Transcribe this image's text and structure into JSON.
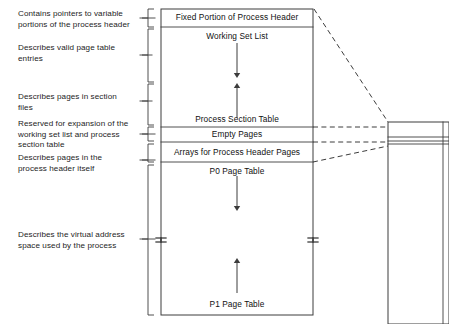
{
  "diagram": {
    "colors": {
      "stroke": "#3c3c3c",
      "text": "#1a1a1a",
      "background": "#ffffff"
    },
    "captions": [
      {
        "id": "caption-variable-portions",
        "text": "Contains pointers to variable\nportions of the process header",
        "x": 18,
        "y": 9,
        "leader_y": 18,
        "leader_x1": 140,
        "leader_x2": 155
      },
      {
        "id": "caption-valid-page-table",
        "text": "Describes valid page table\nentries",
        "x": 18,
        "y": 43,
        "leader_y": 55,
        "leader_x1": 140,
        "leader_x2": 152
      },
      {
        "id": "caption-section-files",
        "text": "Describes pages in section\nfiles",
        "x": 18,
        "y": 92,
        "leader_y": 101,
        "leader_x1": 140,
        "leader_x2": 152
      },
      {
        "id": "caption-reserved-expansion",
        "text": "Reserved for expansion of the\nworking set list and process\nsection table",
        "x": 18,
        "y": 119,
        "leader_y": 134,
        "leader_x1": 140,
        "leader_x2": 155
      },
      {
        "id": "caption-process-header",
        "text": "Describes pages in the\nprocess header itself",
        "x": 18,
        "y": 153,
        "leader_y": 160,
        "leader_x1": 140,
        "leader_x2": 155
      },
      {
        "id": "caption-virtual-address",
        "text": "Describes the virtual address\nspace used by the process",
        "x": 18,
        "y": 230,
        "leader_y": 239,
        "leader_x1": 140,
        "leader_x2": 155
      }
    ],
    "brackets": [
      {
        "id": "bracket-fixed-portion",
        "top": 9,
        "bottom": 27,
        "x": 148,
        "tip_y": 18
      },
      {
        "id": "bracket-working-set",
        "top": 29,
        "bottom": 82,
        "x": 148,
        "tip_y": 55
      },
      {
        "id": "bracket-process-section",
        "top": 84,
        "bottom": 125,
        "x": 148,
        "tip_y": 101
      },
      {
        "id": "bracket-empty-pages",
        "top": 127,
        "bottom": 141,
        "x": 148,
        "tip_y": 134
      },
      {
        "id": "bracket-arrays",
        "top": 144,
        "bottom": 162,
        "x": 148,
        "tip_y": 160
      },
      {
        "id": "bracket-page-tables",
        "top": 165,
        "bottom": 315,
        "x": 148,
        "tip_y": 239
      }
    ],
    "main_box": {
      "x": 161,
      "y": 9,
      "width": 152,
      "height": 306,
      "dividers": [
        27,
        127,
        142,
        162
      ],
      "break_marks": [
        {
          "x": 161,
          "y": 238
        },
        {
          "x": 313,
          "y": 238
        }
      ],
      "sections": [
        {
          "id": "section-fixed-portion",
          "label": "Fixed Portion of Process Header",
          "x": 161,
          "y": 12,
          "width": 152
        },
        {
          "id": "section-working-set",
          "label": "Working Set List",
          "x": 161,
          "y": 31,
          "width": 152
        },
        {
          "id": "section-process-table",
          "label": "Process Section Table",
          "x": 161,
          "y": 114,
          "width": 152
        },
        {
          "id": "section-empty-pages",
          "label": "Empty Pages",
          "x": 161,
          "y": 129,
          "width": 152
        },
        {
          "id": "section-arrays",
          "label": "Arrays for Process Header Pages",
          "x": 161,
          "y": 147,
          "width": 152
        },
        {
          "id": "section-p0-page-table",
          "label": "P0 Page Table",
          "x": 161,
          "y": 166,
          "width": 152
        },
        {
          "id": "section-p1-page-table",
          "label": "P1 Page Table",
          "x": 161,
          "y": 299,
          "width": 152
        }
      ],
      "arrows": [
        {
          "id": "arrow-working-set-down",
          "x": 237,
          "y1": 43,
          "y2": 78,
          "direction": "down"
        },
        {
          "id": "arrow-process-table-up",
          "x": 237,
          "y1": 118,
          "y2": 83,
          "direction": "up"
        },
        {
          "id": "arrow-p0-page-table-down",
          "x": 237,
          "y1": 176,
          "y2": 211,
          "direction": "down"
        },
        {
          "id": "arrow-p1-page-table-up",
          "x": 237,
          "y1": 293,
          "y2": 258,
          "direction": "up"
        }
      ]
    },
    "detail_box": {
      "id": "detail-box",
      "x": 388,
      "y": 122,
      "width": 61,
      "height": 202,
      "inner_lines": [
        137,
        141,
        144
      ],
      "right_inner_x": 443
    },
    "connectors": [
      {
        "id": "connector-top",
        "x1": 314,
        "y1": 9,
        "x2": 388,
        "y2": 122
      },
      {
        "id": "connector-mid-1",
        "x1": 313,
        "y1": 127,
        "x2": 388,
        "y2": 127
      },
      {
        "id": "connector-mid-2",
        "x1": 313,
        "y1": 142,
        "x2": 388,
        "y2": 142
      },
      {
        "id": "connector-bottom",
        "x1": 313,
        "y1": 162,
        "x2": 388,
        "y2": 146
      }
    ]
  }
}
